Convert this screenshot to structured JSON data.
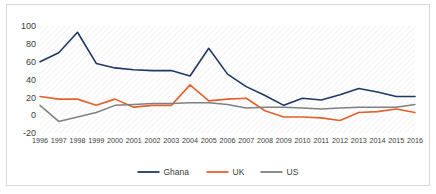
{
  "chart_data": {
    "type": "line",
    "title": "",
    "xlabel": "",
    "ylabel": "",
    "ylim": [
      -20,
      100
    ],
    "yticks": [
      -20,
      0,
      20,
      40,
      60,
      80,
      100
    ],
    "ytick_labels": [
      "-20",
      "0",
      "20",
      "40",
      "60",
      "80",
      "100"
    ],
    "grid": false,
    "legend_position": "bottom",
    "categories": [
      "1996",
      "1997",
      "1998",
      "1999",
      "2000",
      "2001",
      "2002",
      "2003",
      "2004",
      "2005",
      "2006",
      "2007",
      "2008",
      "2009",
      "2010",
      "2011",
      "2012",
      "2013",
      "2014",
      "2015",
      "2016"
    ],
    "series": [
      {
        "name": "Ghana",
        "color": "#1F3864",
        "values": [
          60,
          70,
          93,
          58,
          53,
          51,
          50,
          50,
          44,
          75,
          46,
          32,
          22,
          11,
          19,
          17,
          23,
          30,
          26,
          21,
          21
        ]
      },
      {
        "name": "UK",
        "color": "#E2622B",
        "values": [
          21,
          18,
          18,
          11,
          18,
          9,
          11,
          11,
          34,
          16,
          18,
          19,
          5,
          -2,
          -2,
          -3,
          -6,
          3,
          4,
          7,
          3
        ]
      },
      {
        "name": "US",
        "color": "#808080",
        "values": [
          11,
          -7,
          -2,
          3,
          11,
          12,
          13,
          13,
          14,
          14,
          12,
          8,
          9,
          9,
          8,
          7,
          8,
          9,
          9,
          9,
          12
        ]
      }
    ]
  },
  "legend": {
    "items": [
      {
        "label": "Ghana",
        "color": "#1F3864"
      },
      {
        "label": "UK",
        "color": "#E2622B"
      },
      {
        "label": "US",
        "color": "#808080"
      }
    ]
  },
  "axes": {
    "y_axis_name": "value-axis",
    "x_axis_name": "year-axis"
  }
}
